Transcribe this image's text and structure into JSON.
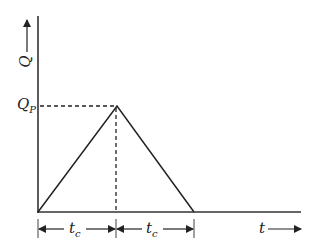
{
  "diagram": {
    "y_axis_label": "Q",
    "x_axis_label": "t",
    "peak_label_main": "Q",
    "peak_label_sub": "P",
    "segment_label_main": "t",
    "segment_label_sub": "c",
    "colors": {
      "line": "#222222",
      "background": "#ffffff"
    },
    "geometry": {
      "origin": [
        38,
        212
      ],
      "peak": [
        117,
        106
      ],
      "end": [
        194,
        212
      ],
      "x_axis_end": 300,
      "y_axis_top": 16
    }
  }
}
